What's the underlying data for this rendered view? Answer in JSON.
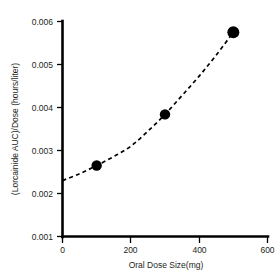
{
  "chart_data": {
    "type": "scatter",
    "title": "",
    "subtitle": "",
    "xlabel": "Oral Dose Size(mg)",
    "ylabel": "(Lorcainide AUC)/Dose (hours/liter)",
    "xlim": [
      0,
      600
    ],
    "ylim": [
      0.001,
      0.006
    ],
    "xticks": [
      0,
      200,
      400,
      600
    ],
    "xtick_labels": [
      "0",
      "200",
      "400",
      "600"
    ],
    "yticks": [
      0.001,
      0.002,
      0.003,
      0.004,
      0.005,
      0.006
    ],
    "ytick_labels": [
      "0.001",
      "0.002",
      "0.003",
      "0.004",
      "0.005",
      "0.006"
    ],
    "grid": false,
    "legend": null,
    "legend_position": "none",
    "marker_style": "filled-circle",
    "marker_color": "#000000",
    "line_style": "dashed",
    "line_color": "#000000",
    "x": [
      100,
      300,
      500
    ],
    "y": [
      0.00265,
      0.00384,
      0.00575
    ],
    "series": [
      {
        "name": "Lorcainide dose-normalized AUC",
        "x": [
          100,
          300,
          500
        ],
        "values": [
          0.00265,
          0.00384,
          0.00575
        ]
      }
    ],
    "fit_curve": {
      "style": "dashed",
      "x": [
        0,
        50,
        100,
        150,
        200,
        250,
        300,
        350,
        400,
        450,
        500
      ],
      "y": [
        0.0023,
        0.00246,
        0.00265,
        0.00286,
        0.0031,
        0.00345,
        0.00384,
        0.00428,
        0.00473,
        0.00522,
        0.00575
      ]
    }
  },
  "axis_titles": {
    "x": "Oral Dose Size(mg)",
    "y": "(Lorcainide AUC)/Dose (hours/liter)"
  },
  "tick_text": {
    "x0": "0",
    "x200": "200",
    "x400": "400",
    "x600": "600",
    "y0001": "0.001",
    "y0002": "0.002",
    "y0003": "0.003",
    "y0004": "0.004",
    "y0005": "0.005",
    "y0006": "0.006"
  }
}
